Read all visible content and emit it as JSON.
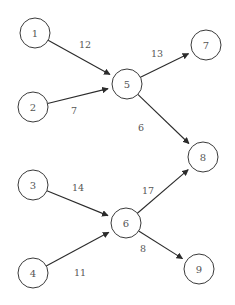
{
  "diagram": {
    "type": "directed-weighted-graph",
    "colors": {
      "background": "#ffffff",
      "node_stroke": "#3a3a3a",
      "node_fill": "#ffffff",
      "edge_stroke": "#2b2b2b",
      "label_text": "#555555"
    },
    "node_radius": 15,
    "nodes": [
      {
        "id": "1",
        "label": "1",
        "cx": 35,
        "cy": 33
      },
      {
        "id": "2",
        "label": "2",
        "cx": 33,
        "cy": 107
      },
      {
        "id": "3",
        "label": "3",
        "cx": 33,
        "cy": 185
      },
      {
        "id": "4",
        "label": "4",
        "cx": 33,
        "cy": 273
      },
      {
        "id": "5",
        "label": "5",
        "cx": 127,
        "cy": 84
      },
      {
        "id": "6",
        "label": "6",
        "cx": 126,
        "cy": 223
      },
      {
        "id": "7",
        "label": "7",
        "cx": 206,
        "cy": 45
      },
      {
        "id": "8",
        "label": "8",
        "cx": 203,
        "cy": 157
      },
      {
        "id": "9",
        "label": "9",
        "cx": 199,
        "cy": 269
      }
    ],
    "edges": [
      {
        "id": "e1",
        "from": "1",
        "to": "5",
        "weight": "12",
        "lx": 85,
        "ly": 44
      },
      {
        "id": "e2",
        "from": "2",
        "to": "5",
        "weight": "7",
        "lx": 74,
        "ly": 110
      },
      {
        "id": "e3",
        "from": "5",
        "to": "7",
        "weight": "13",
        "lx": 157,
        "ly": 53
      },
      {
        "id": "e4",
        "from": "5",
        "to": "8",
        "weight": "6",
        "lx": 141,
        "ly": 127
      },
      {
        "id": "e5",
        "from": "3",
        "to": "6",
        "weight": "14",
        "lx": 78,
        "ly": 187
      },
      {
        "id": "e6",
        "from": "4",
        "to": "6",
        "weight": "11",
        "lx": 80,
        "ly": 272
      },
      {
        "id": "e7",
        "from": "6",
        "to": "8",
        "weight": "17",
        "lx": 148,
        "ly": 190
      },
      {
        "id": "e8",
        "from": "6",
        "to": "9",
        "weight": "8",
        "lx": 143,
        "ly": 248
      }
    ]
  }
}
